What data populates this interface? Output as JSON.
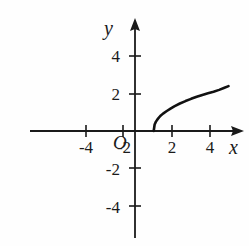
{
  "figure": {
    "background_color": "#fefefe",
    "ink_color": "#1a1a1a",
    "width": 249,
    "height": 246
  },
  "axes": {
    "x_label": "x",
    "y_label": "y",
    "origin_label": "O",
    "x_ticks": [
      {
        "value": -4,
        "label": "-4"
      },
      {
        "value": -2,
        "label": "-2"
      },
      {
        "value": 2,
        "label": "2"
      },
      {
        "value": 4,
        "label": "4"
      }
    ],
    "y_ticks": [
      {
        "value": 4,
        "label": "4"
      },
      {
        "value": 2,
        "label": "2"
      },
      {
        "value": -2,
        "label": "-2"
      },
      {
        "value": -4,
        "label": "-4"
      }
    ]
  },
  "chart_data": {
    "type": "line",
    "title": "",
    "xlabel": "x",
    "ylabel": "y",
    "xlim": [
      -5.6,
      5.8
    ],
    "ylim": [
      -5.5,
      5.5
    ],
    "grid": false,
    "legend": "none",
    "annotations": [],
    "series": [
      {
        "name": "y = sqrt(x - 1)",
        "domain_start": 1,
        "domain_end": 5.0,
        "color": "#111111",
        "line_width": 2.6,
        "x": [
          1.0,
          1.05,
          1.12,
          1.2,
          1.35,
          1.5,
          1.7,
          1.9,
          2.1,
          2.4,
          2.7,
          3.0,
          3.3,
          3.6,
          3.9,
          4.2,
          4.5,
          4.75,
          5.0
        ],
        "y": [
          0.0,
          0.35,
          0.5,
          0.62,
          0.8,
          0.93,
          1.07,
          1.2,
          1.32,
          1.47,
          1.6,
          1.72,
          1.83,
          1.93,
          2.02,
          2.1,
          2.2,
          2.3,
          2.4
        ]
      }
    ]
  }
}
